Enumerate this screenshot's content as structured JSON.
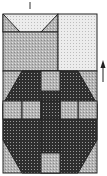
{
  "diagram": {
    "type": "quilt-block-pattern",
    "colors": {
      "outline": "#222222",
      "light_fabric": "#e6e6e6",
      "medium_fabric": "#b8b8b8",
      "dark_fabric": "#333333",
      "background": "#ffffff"
    },
    "arrow": {
      "direction": "up",
      "glyph": "↑"
    },
    "top_mark": "|"
  }
}
